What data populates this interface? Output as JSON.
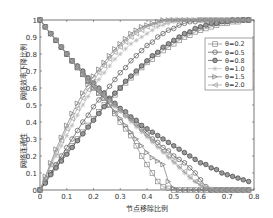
{
  "chart_data": {
    "type": "line",
    "title": "",
    "xlabel": "节点移除比例",
    "ylabel_upper": "网络效率下降比例",
    "ylabel_lower": "网络连通性",
    "xlim": [
      0,
      0.8
    ],
    "ylim": [
      0,
      1
    ],
    "xticks": [
      "0",
      "0.1",
      "0.2",
      "0.3",
      "0.4",
      "0.5",
      "0.6",
      "0.7",
      "0.8"
    ],
    "yticks": [
      "0",
      "0.1",
      "0.2",
      "0.3",
      "0.4",
      "0.5",
      "0.6",
      "0.7",
      "0.8",
      "0.9",
      "1"
    ],
    "legend_position": "upper right",
    "grid": false,
    "x": [
      0,
      0.02,
      0.04,
      0.06,
      0.08,
      0.1,
      0.12,
      0.14,
      0.16,
      0.18,
      0.2,
      0.22,
      0.24,
      0.26,
      0.28,
      0.3,
      0.32,
      0.34,
      0.36,
      0.38,
      0.4,
      0.42,
      0.44,
      0.46,
      0.48,
      0.5,
      0.52,
      0.54,
      0.56,
      0.58,
      0.6,
      0.62,
      0.64,
      0.66,
      0.68,
      0.7,
      0.72,
      0.74,
      0.76,
      0.78
    ],
    "series": [
      {
        "name": "θ=0.2",
        "marker": "square",
        "color": "#888888",
        "connectivity": [
          1,
          0.96,
          0.92,
          0.88,
          0.84,
          0.8,
          0.76,
          0.72,
          0.68,
          0.64,
          0.6,
          0.57,
          0.54,
          0.5,
          0.45,
          0.4,
          0.36,
          0.32,
          0.26,
          0.2,
          0.15,
          0.1,
          0.05,
          0.02,
          0.01,
          0,
          0,
          0,
          0,
          0,
          0,
          0,
          0,
          0,
          0,
          0,
          0,
          0,
          0,
          0
        ],
        "efficiency_drop": [
          0,
          0.05,
          0.1,
          0.14,
          0.18,
          0.22,
          0.26,
          0.3,
          0.34,
          0.38,
          0.42,
          0.46,
          0.5,
          0.53,
          0.56,
          0.6,
          0.63,
          0.66,
          0.69,
          0.72,
          0.75,
          0.77,
          0.8,
          0.82,
          0.84,
          0.86,
          0.88,
          0.9,
          0.91,
          0.93,
          0.94,
          0.95,
          0.96,
          0.97,
          0.98,
          0.98,
          0.99,
          0.99,
          1,
          1
        ]
      },
      {
        "name": "θ=0.5",
        "marker": "circle",
        "color": "#555555",
        "connectivity": [
          1,
          0.96,
          0.92,
          0.88,
          0.84,
          0.8,
          0.76,
          0.72,
          0.68,
          0.65,
          0.62,
          0.59,
          0.56,
          0.53,
          0.5,
          0.47,
          0.44,
          0.42,
          0.39,
          0.36,
          0.33,
          0.3,
          0.28,
          0.25,
          0.23,
          0.2,
          0.18,
          0.16,
          0.13,
          0.1,
          0.06,
          0.02,
          0,
          0,
          0,
          0,
          0,
          0,
          0,
          0
        ],
        "efficiency_drop": [
          0,
          0.05,
          0.1,
          0.15,
          0.2,
          0.25,
          0.3,
          0.35,
          0.4,
          0.44,
          0.49,
          0.53,
          0.57,
          0.61,
          0.65,
          0.69,
          0.72,
          0.76,
          0.79,
          0.82,
          0.85,
          0.87,
          0.9,
          0.92,
          0.94,
          0.95,
          0.97,
          0.98,
          0.99,
          0.99,
          1,
          1,
          1,
          1,
          1,
          1,
          1,
          1,
          1,
          1
        ]
      },
      {
        "name": "θ=0.8",
        "marker": "circle-filled",
        "color": "#444444",
        "connectivity": [
          1,
          0.96,
          0.92,
          0.88,
          0.84,
          0.8,
          0.76,
          0.73,
          0.7,
          0.66,
          0.63,
          0.6,
          0.57,
          0.54,
          0.51,
          0.48,
          0.46,
          0.43,
          0.41,
          0.38,
          0.36,
          0.34,
          0.32,
          0.3,
          0.28,
          0.26,
          0.24,
          0.22,
          0.2,
          0.18,
          0.16,
          0.15,
          0.13,
          0.12,
          0.1,
          0.09,
          0.08,
          0.07,
          0.06,
          0.05
        ],
        "efficiency_drop": [
          0,
          0.04,
          0.09,
          0.13,
          0.17,
          0.21,
          0.25,
          0.29,
          0.33,
          0.37,
          0.41,
          0.45,
          0.49,
          0.53,
          0.57,
          0.6,
          0.64,
          0.67,
          0.7,
          0.73,
          0.76,
          0.79,
          0.81,
          0.84,
          0.86,
          0.88,
          0.9,
          0.92,
          0.93,
          0.95,
          0.96,
          0.97,
          0.98,
          0.98,
          0.99,
          0.99,
          1,
          1,
          1,
          1
        ]
      },
      {
        "name": "θ=1.0",
        "marker": "star",
        "color": "#bbbbbb",
        "connectivity": [
          1,
          0.96,
          0.92,
          0.88,
          0.84,
          0.8,
          0.76,
          0.72,
          0.68,
          0.64,
          0.61,
          0.58,
          0.55,
          0.52,
          0.49,
          0.46,
          0.43,
          0.4,
          0.37,
          0.34,
          0.31,
          0.28,
          0.25,
          0.22,
          0.19,
          0.16,
          0.13,
          0.1,
          0.07,
          0.05,
          0.03,
          0.02,
          0.01,
          0,
          0,
          0,
          0,
          0,
          0,
          0
        ],
        "efficiency_drop": [
          0,
          0.07,
          0.14,
          0.2,
          0.26,
          0.32,
          0.38,
          0.44,
          0.5,
          0.55,
          0.6,
          0.65,
          0.69,
          0.73,
          0.77,
          0.8,
          0.83,
          0.86,
          0.88,
          0.9,
          0.92,
          0.94,
          0.96,
          0.97,
          0.98,
          0.99,
          1,
          1,
          1,
          1,
          1,
          1,
          1,
          1,
          1,
          1,
          1,
          1,
          1,
          1
        ]
      },
      {
        "name": "θ=1.5",
        "marker": "triangle-right",
        "color": "#777777",
        "connectivity": [
          1,
          0.96,
          0.92,
          0.88,
          0.84,
          0.8,
          0.76,
          0.72,
          0.68,
          0.64,
          0.6,
          0.57,
          0.54,
          0.5,
          0.46,
          0.42,
          0.38,
          0.34,
          0.3,
          0.26,
          0.22,
          0.19,
          0.17,
          0.15,
          0.05,
          0.01,
          0,
          0,
          0,
          0,
          0,
          0,
          0,
          0,
          0,
          0,
          0,
          0,
          0,
          0
        ],
        "efficiency_drop": [
          0,
          0.08,
          0.16,
          0.24,
          0.31,
          0.38,
          0.45,
          0.51,
          0.57,
          0.62,
          0.67,
          0.71,
          0.75,
          0.79,
          0.83,
          0.86,
          0.89,
          0.92,
          0.94,
          0.96,
          0.97,
          0.98,
          0.99,
          1,
          1,
          1,
          1,
          1,
          1,
          1,
          1,
          1,
          1,
          1,
          1,
          1,
          1,
          1,
          1,
          1
        ]
      },
      {
        "name": "θ=2.0",
        "marker": "triangle-left",
        "color": "#999999",
        "connectivity": [
          1,
          0.96,
          0.92,
          0.88,
          0.84,
          0.8,
          0.76,
          0.72,
          0.68,
          0.65,
          0.62,
          0.59,
          0.56,
          0.53,
          0.5,
          0.47,
          0.44,
          0.41,
          0.38,
          0.35,
          0.32,
          0.29,
          0.26,
          0.23,
          0.2,
          0.17,
          0.14,
          0.11,
          0.08,
          0.05,
          0.03,
          0.01,
          0,
          0,
          0,
          0,
          0,
          0,
          0,
          0
        ],
        "efficiency_drop": [
          0,
          0.07,
          0.15,
          0.22,
          0.29,
          0.36,
          0.42,
          0.48,
          0.54,
          0.59,
          0.64,
          0.69,
          0.73,
          0.77,
          0.81,
          0.84,
          0.87,
          0.9,
          0.92,
          0.94,
          0.96,
          0.97,
          0.98,
          0.99,
          1,
          1,
          1,
          1,
          1,
          1,
          1,
          1,
          1,
          1,
          1,
          1,
          1,
          1,
          1,
          1
        ]
      }
    ]
  }
}
